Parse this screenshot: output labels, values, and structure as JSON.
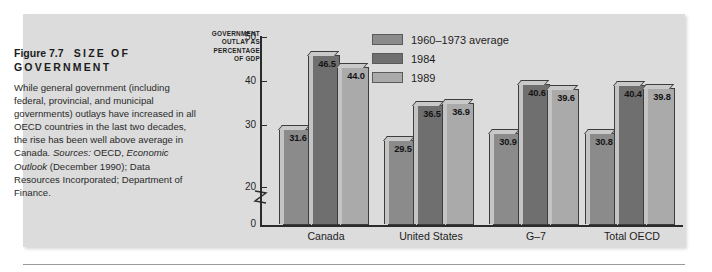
{
  "figure": {
    "number": "Figure 7.7",
    "title": "SIZE OF GOVERNMENT",
    "title_line1_num": "Figure 7.7",
    "title_line1_text": "SIZE OF",
    "title_line2_text": "GOVERNMENT",
    "caption": "While general government (including federal, provincial, and municipal governments) outlays have increased in all OECD countries in the last two decades, the rise has been well above average in Canada. Sources: OECD, Economic Outlook (December 1990); Data Resources Incorporated; Department of Finance."
  },
  "chart_data": {
    "type": "bar",
    "title": "",
    "xlabel": "",
    "ylabel": "GOVERNMENT OUTLAY AS PERCENTAGE OF GDP",
    "ylabel_lines": [
      "GOVERNMENT",
      "OUTLAY AS",
      "PERCENTAGE",
      "OF GDP"
    ],
    "categories": [
      "Canada",
      "United States",
      "G–7",
      "Total OECD"
    ],
    "series": [
      {
        "name": "1960–1973 average",
        "color": "#8b8b8b",
        "values": [
          31.6,
          29.5,
          30.9,
          30.8
        ]
      },
      {
        "name": "1984",
        "color": "#6f6f6f",
        "values": [
          46.5,
          36.5,
          40.6,
          40.4
        ]
      },
      {
        "name": "1989",
        "color": "#aaaaaa",
        "values": [
          44.0,
          36.9,
          39.6,
          39.8
        ]
      }
    ],
    "value_labels": [
      [
        "31.6",
        "46.5",
        "44.0"
      ],
      [
        "29.5",
        "36.5",
        "36.9"
      ],
      [
        "30.9",
        "40.6",
        "39.6"
      ],
      [
        "30.8",
        "40.4",
        "39.8"
      ]
    ],
    "ylim": [
      0,
      50
    ],
    "yticks": [
      50,
      40,
      30,
      20,
      0
    ],
    "ytick_labels": [
      "50",
      "40",
      "30",
      "20",
      "0"
    ],
    "axis_break": true,
    "axis_break_between": [
      20,
      0
    ],
    "grid": false,
    "legend_position": "top-center"
  },
  "legend": {
    "items": [
      {
        "label": "1960–1973 average",
        "color": "#8b8b8b"
      },
      {
        "label": "1984",
        "color": "#6f6f6f"
      },
      {
        "label": "1989",
        "color": "#aaaaaa"
      }
    ]
  }
}
